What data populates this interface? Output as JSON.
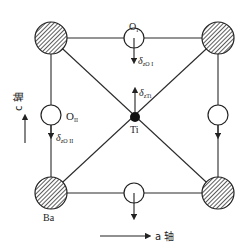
{
  "diagram": {
    "colors": {
      "line": "#2a2a2a",
      "ba_fill": "#9a9a9a",
      "ti_fill": "#111111",
      "o_fill": "#ffffff",
      "background": "#ffffff"
    },
    "atoms": {
      "ba_label": "Ba",
      "ti_label": "Ti",
      "o1_label": "O",
      "o1_sub": "I",
      "o2_label": "O",
      "o2_sub": "II"
    },
    "displacements": {
      "o1": {
        "delta": "δ",
        "sub": "zO I"
      },
      "ti": {
        "delta": "δ",
        "sub": "zTi"
      },
      "o2": {
        "delta": "δ",
        "sub": "zO II"
      }
    },
    "axes": {
      "c_axis_label": "c 轴",
      "a_axis_label": "a 轴"
    }
  }
}
